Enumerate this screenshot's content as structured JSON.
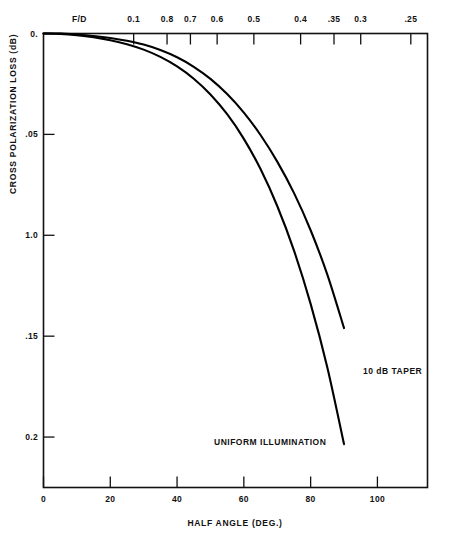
{
  "chart_data": {
    "type": "line",
    "title": "",
    "xlabel": "HALF ANGLE (DEG.)",
    "ylabel": "CROSS POLARIZATION LOSS (dB)",
    "xlim": [
      0,
      115
    ],
    "ylim": [
      0,
      0.225
    ],
    "y_inverted": true,
    "grid": false,
    "legend_position": "inline-annotations",
    "x_ticks": [
      0,
      20,
      40,
      60,
      80,
      100
    ],
    "x_tick_labels": [
      "0",
      "20",
      "40",
      "60",
      "80",
      "100"
    ],
    "y_ticks": [
      0,
      0.05,
      0.1,
      0.15,
      0.2
    ],
    "y_tick_labels": [
      "0.",
      ".05",
      "1.0",
      ".15",
      "0.2"
    ],
    "secondary_axis": {
      "label": "F/D",
      "position": "top",
      "tick_values": [
        27,
        37,
        44,
        52,
        63,
        77,
        87,
        95,
        110
      ],
      "tick_labels": [
        "0.1",
        "0.8",
        "0.7",
        "0.6",
        "0.5",
        "0.4",
        ".35",
        "0.3",
        ".25"
      ]
    },
    "series": [
      {
        "name": "10 dB TAPER",
        "annotation": "10 dB TAPER",
        "x": [
          0,
          5,
          10,
          15,
          20,
          25,
          30,
          35,
          40,
          45,
          50,
          55,
          60,
          65,
          70,
          75,
          80,
          85,
          90
        ],
        "y": [
          0.0,
          0.0,
          0.0005,
          0.0012,
          0.0022,
          0.0036,
          0.0055,
          0.0082,
          0.0118,
          0.0165,
          0.0225,
          0.03,
          0.0392,
          0.0503,
          0.0635,
          0.079,
          0.0975,
          0.1195,
          0.146
        ]
      },
      {
        "name": "UNIFORM ILLUMINATION",
        "annotation": "UNIFORM ILLUMINATION",
        "x": [
          0,
          5,
          10,
          15,
          20,
          25,
          30,
          35,
          40,
          45,
          50,
          55,
          60,
          65,
          70,
          75,
          80,
          85,
          90
        ],
        "y": [
          0.0,
          0.0002,
          0.0008,
          0.0018,
          0.0033,
          0.0053,
          0.008,
          0.0116,
          0.0163,
          0.0224,
          0.0302,
          0.04,
          0.0522,
          0.0672,
          0.0855,
          0.1075,
          0.134,
          0.1655,
          0.2035
        ]
      }
    ],
    "annotations": [
      {
        "text": "10 dB TAPER",
        "x_px": 363,
        "y_px": 366
      },
      {
        "text": "UNIFORM ILLUMINATION",
        "x_px": 214,
        "y_px": 437
      }
    ]
  },
  "colors": {
    "background": "#ffffff",
    "axis": "#111111",
    "curve": "#000000",
    "text": "#111111"
  }
}
